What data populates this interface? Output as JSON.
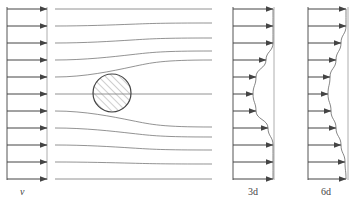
{
  "figure": {
    "colors": {
      "line": "#555555",
      "streamline": "#777777",
      "arrow": "#444444",
      "hatch": "#888888",
      "background": "#ffffff"
    },
    "panels": [
      {
        "id": "inlet",
        "label": "v",
        "label_italic": true,
        "baseline_x": 7,
        "frame_x": 47,
        "arrow_ends": [
          47,
          47,
          47,
          47,
          47,
          47,
          47,
          47,
          47,
          47,
          47
        ]
      },
      {
        "id": "wake-3d",
        "label": "3d",
        "baseline_x": 233,
        "frame_x": 274,
        "arrow_ends": [
          273,
          273,
          273,
          266,
          256,
          253,
          256,
          268,
          273,
          273,
          273
        ]
      },
      {
        "id": "wake-6d",
        "label": "6d",
        "baseline_x": 308,
        "frame_x": 348,
        "arrow_ends": [
          346,
          346,
          341,
          336,
          330,
          328,
          331,
          336,
          341,
          345,
          346
        ]
      }
    ],
    "arrow_rows_y": [
      9,
      26,
      43,
      60,
      77,
      94,
      111,
      128,
      145,
      162,
      179
    ],
    "streamlines": {
      "x_start": 55,
      "x_end": 212,
      "start_y": [
        9,
        26,
        43,
        60,
        77,
        94,
        111,
        128,
        145,
        162,
        179
      ],
      "end_y": [
        9,
        23,
        38,
        51,
        60,
        94,
        127,
        137,
        150,
        164,
        179
      ]
    },
    "cylinder": {
      "cx": 112,
      "cy": 93,
      "r": 19,
      "hatched": true
    }
  }
}
